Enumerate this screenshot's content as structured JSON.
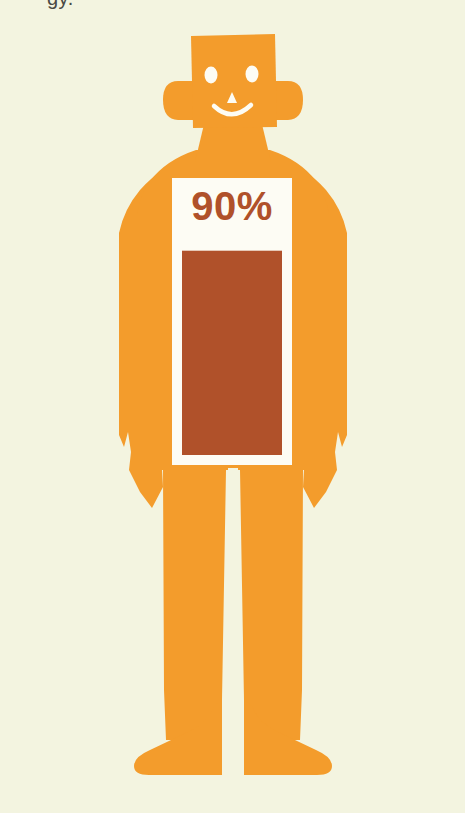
{
  "figure": {
    "title_fragment": "gy.",
    "stat_label": "90%",
    "icon_names": {
      "person": "person-icon",
      "head": "head-icon",
      "eye_left": "eye-left-icon",
      "eye_right": "eye-right-icon",
      "nose": "nose-icon",
      "mouth": "smile-icon",
      "ear_left": "ear-left-icon",
      "ear_right": "ear-right-icon",
      "arm_left": "arm-left-icon",
      "arm_right": "arm-right-icon",
      "hand_left": "hand-left-icon",
      "hand_right": "hand-right-icon",
      "leg_left": "leg-left-icon",
      "leg_right": "leg-right-icon",
      "foot_left": "foot-left-icon",
      "foot_right": "foot-right-icon"
    }
  },
  "colors": {
    "background": "#f3f4e0",
    "page": "#ffffff",
    "body_orange": "#f39c2c",
    "body_shade": "#eb9524",
    "panel_white": "#fdfcf4",
    "bar_fill": "#b0512a",
    "stat_text": "#b0512a",
    "face_feature": "#fdfcf4",
    "caption_text": "#4a4a44"
  },
  "chart_data": {
    "type": "bar",
    "title": "90%",
    "categories": [
      "value"
    ],
    "values": [
      90
    ],
    "ylim": [
      0,
      100
    ],
    "unit": "%",
    "labels": [
      "90%"
    ],
    "xlabel": "",
    "ylabel": "",
    "grid": false,
    "legend": false,
    "orientation": "vertical",
    "fill_color": "#b0512a",
    "panel_color": "#fdfcf4"
  },
  "geometry": {
    "canvas_width": 465,
    "canvas_height": 813,
    "panel": {
      "x": 172,
      "y": 178,
      "width": 120,
      "height": 287
    },
    "bar": {
      "x": 182,
      "y": 228,
      "width": 100,
      "height": 227
    }
  }
}
